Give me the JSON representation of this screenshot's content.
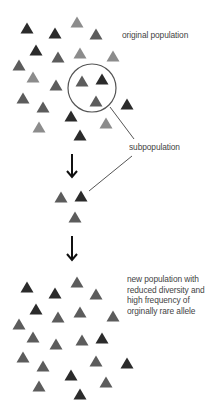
{
  "colors": {
    "dark": "#2b2b2b",
    "medium": "#5c5c5c",
    "light": "#8c8c8c",
    "line": "#555555",
    "arrow": "#111111",
    "text": "#444444"
  },
  "triangle_size": {
    "width": 13,
    "height": 11
  },
  "labels": {
    "original": "original population",
    "subpopulation": "subpopulation",
    "new_population": [
      "new population with",
      "reduced diversity and",
      "high frequency of",
      "orginally rare allele"
    ]
  },
  "original_population": [
    {
      "x": 27,
      "y": 28,
      "shade": "dark"
    },
    {
      "x": 55,
      "y": 33,
      "shade": "dark"
    },
    {
      "x": 77,
      "y": 22,
      "shade": "light"
    },
    {
      "x": 96,
      "y": 34,
      "shade": "medium"
    },
    {
      "x": 36,
      "y": 50,
      "shade": "dark"
    },
    {
      "x": 58,
      "y": 57,
      "shade": "medium"
    },
    {
      "x": 80,
      "y": 53,
      "shade": "light"
    },
    {
      "x": 113,
      "y": 56,
      "shade": "light"
    },
    {
      "x": 19,
      "y": 65,
      "shade": "medium"
    },
    {
      "x": 33,
      "y": 77,
      "shade": "light"
    },
    {
      "x": 56,
      "y": 85,
      "shade": "medium"
    },
    {
      "x": 82,
      "y": 81,
      "shade": "medium"
    },
    {
      "x": 102,
      "y": 79,
      "shade": "dark"
    },
    {
      "x": 23,
      "y": 98,
      "shade": "medium"
    },
    {
      "x": 96,
      "y": 101,
      "shade": "medium"
    },
    {
      "x": 127,
      "y": 104,
      "shade": "dark"
    },
    {
      "x": 43,
      "y": 107,
      "shade": "medium"
    },
    {
      "x": 71,
      "y": 116,
      "shade": "dark"
    },
    {
      "x": 106,
      "y": 123,
      "shade": "light"
    },
    {
      "x": 39,
      "y": 127,
      "shade": "light"
    },
    {
      "x": 80,
      "y": 135,
      "shade": "dark"
    }
  ],
  "subpopulation_circle": {
    "cx": 92,
    "cy": 88,
    "r": 24
  },
  "subpopulation": [
    {
      "x": 61,
      "y": 197,
      "shade": "medium"
    },
    {
      "x": 81,
      "y": 196,
      "shade": "dark"
    },
    {
      "x": 75,
      "y": 217,
      "shade": "medium"
    }
  ],
  "new_population": [
    {
      "x": 27,
      "y": 287,
      "shade": "dark"
    },
    {
      "x": 55,
      "y": 293,
      "shade": "dark"
    },
    {
      "x": 77,
      "y": 282,
      "shade": "medium"
    },
    {
      "x": 96,
      "y": 294,
      "shade": "medium"
    },
    {
      "x": 36,
      "y": 309,
      "shade": "dark"
    },
    {
      "x": 58,
      "y": 317,
      "shade": "medium"
    },
    {
      "x": 80,
      "y": 312,
      "shade": "medium"
    },
    {
      "x": 113,
      "y": 316,
      "shade": "medium"
    },
    {
      "x": 19,
      "y": 324,
      "shade": "medium"
    },
    {
      "x": 33,
      "y": 337,
      "shade": "medium"
    },
    {
      "x": 56,
      "y": 344,
      "shade": "medium"
    },
    {
      "x": 82,
      "y": 340,
      "shade": "medium"
    },
    {
      "x": 102,
      "y": 338,
      "shade": "dark"
    },
    {
      "x": 23,
      "y": 357,
      "shade": "medium"
    },
    {
      "x": 96,
      "y": 361,
      "shade": "medium"
    },
    {
      "x": 127,
      "y": 363,
      "shade": "dark"
    },
    {
      "x": 43,
      "y": 366,
      "shade": "medium"
    },
    {
      "x": 71,
      "y": 375,
      "shade": "dark"
    },
    {
      "x": 106,
      "y": 382,
      "shade": "medium"
    },
    {
      "x": 39,
      "y": 386,
      "shade": "medium"
    },
    {
      "x": 80,
      "y": 394,
      "shade": "dark"
    }
  ],
  "connector_lines": [
    {
      "x1": 110,
      "y1": 107,
      "x2": 134,
      "y2": 139
    },
    {
      "x1": 132,
      "y1": 156,
      "x2": 89,
      "y2": 191
    }
  ],
  "arrows": [
    {
      "x": 72,
      "y1": 154,
      "y2": 177
    },
    {
      "x": 72,
      "y1": 236,
      "y2": 260
    }
  ]
}
